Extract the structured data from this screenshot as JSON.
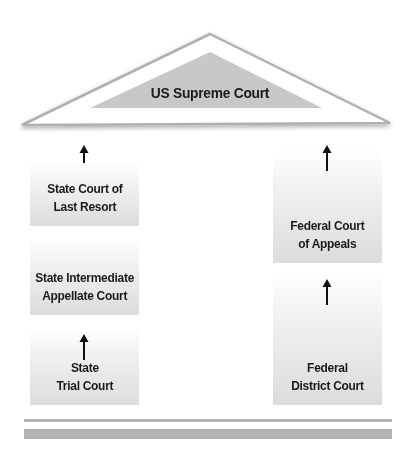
{
  "diagram": {
    "type": "court-hierarchy",
    "roof": {
      "label": "US Supreme Court",
      "outer_fill": "#ffffff",
      "outer_stroke": "#b0b0b0",
      "inner_fill": "#c8c8c8"
    },
    "state_column": {
      "courts": [
        {
          "label": "State Court of\nLast Resort"
        },
        {
          "label": "State Intermediate\nAppellate Court"
        },
        {
          "label": "State\nTrial Court"
        }
      ]
    },
    "federal_column": {
      "courts": [
        {
          "label": "Federal Court\nof Appeals"
        },
        {
          "label": "Federal\nDistrict Court"
        }
      ]
    },
    "arrow_direction": "up",
    "colors": {
      "box_gradient_top": "#ffffff",
      "box_gradient_bottom": "#dcdcdc",
      "text": "#1a1a1a",
      "base": "#b3b3b3"
    }
  }
}
